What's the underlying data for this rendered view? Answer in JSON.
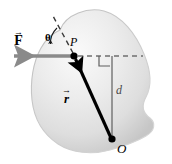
{
  "figure": {
    "type": "physics-vector-diagram",
    "background_color": "#ffffff"
  },
  "body_shape": {
    "name": "rigid-body-blob",
    "fill_light": "#f2f2f2",
    "fill_mid": "#dcdcdc",
    "fill_dark": "#c3c3c3",
    "outline_color": "#9a9a9a"
  },
  "labels": {
    "force_vector": "F",
    "position_vector": "r",
    "moment_arm": "d",
    "point_of_application": "P",
    "axis_point": "O",
    "angle": "θ",
    "vector_arrow_glyph": "→"
  },
  "elements": {
    "force_arrow": {
      "name": "force-vector-arrow",
      "color": "#8a8a8a",
      "direction": "left",
      "from": [
        75,
        56
      ],
      "to": [
        12,
        56
      ]
    },
    "position_arrow": {
      "name": "position-vector-arrow",
      "color": "#000000",
      "direction": "up-left",
      "from": [
        112,
        139
      ],
      "to": [
        74,
        56
      ]
    },
    "dashed_line_of_action": {
      "name": "line-of-action-dashed",
      "color": "#6f6f6f",
      "style": "dashed",
      "from": [
        75,
        56
      ],
      "to": [
        141,
        56
      ]
    },
    "dashed_extension": {
      "name": "position-vector-extension-dashed",
      "color": "#3a3a3a",
      "style": "dashed",
      "from": [
        74,
        55
      ],
      "to": [
        53,
        17
      ]
    },
    "moment_arm_line": {
      "name": "moment-arm-line",
      "color": "#5a5a5a",
      "from": [
        112,
        56
      ],
      "to": [
        112,
        139
      ]
    },
    "right_angle_marker": {
      "name": "right-angle-marker",
      "color": "#5a5a5a"
    },
    "angle_arc": {
      "name": "angle-arc-theta",
      "color": "#1a1a1a"
    },
    "point_P_dot": {
      "name": "point-p-dot",
      "color": "#000000",
      "cx": 74,
      "cy": 56,
      "r": 3.4
    },
    "point_O_dot": {
      "name": "point-o-dot",
      "color": "#000000",
      "cx": 112,
      "cy": 139,
      "r": 3.4
    }
  }
}
